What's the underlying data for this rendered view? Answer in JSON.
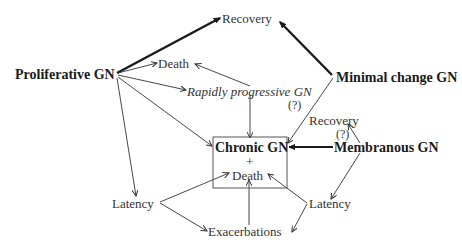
{
  "diagram": {
    "type": "flow-diagram",
    "topic": "Natural history of glomerulonephritis",
    "nodes": {
      "recovery_top": "Recovery",
      "proliferative": "Proliferative GN",
      "death_top": "Death",
      "rapidly_progressive": "Rapidly progressive GN",
      "rapidly_progressive_q": "(?)",
      "minimal_change": "Minimal change GN",
      "recovery_right": "Recovery",
      "recovery_right_q": "(?)",
      "membranous": "Membranous GN",
      "chronic_gn": "Chronic GN",
      "chronic_plus": "+",
      "chronic_death": "Death",
      "latency_left": "Latency",
      "latency_right": "Latency",
      "exacerbations": "Exacerbations"
    },
    "edges": [
      {
        "from": "Proliferative GN",
        "to": "Recovery",
        "weight": "heavy"
      },
      {
        "from": "Minimal change GN",
        "to": "Recovery",
        "weight": "heavy"
      },
      {
        "from": "Proliferative GN",
        "to": "Death",
        "weight": "thin"
      },
      {
        "from": "Proliferative GN",
        "to": "Rapidly progressive GN",
        "weight": "thin"
      },
      {
        "from": "Proliferative GN",
        "to": "Chronic GN + Death",
        "weight": "thin"
      },
      {
        "from": "Proliferative GN",
        "to": "Latency (left)",
        "weight": "thin"
      },
      {
        "from": "Rapidly progressive GN",
        "to": "Death",
        "weight": "thin"
      },
      {
        "from": "Rapidly progressive GN",
        "to": "Chronic GN + Death",
        "weight": "thin"
      },
      {
        "from": "Minimal change GN",
        "to": "Chronic GN + Death",
        "weight": "thin",
        "note": "(?)"
      },
      {
        "from": "Membranous GN",
        "to": "Chronic GN + Death",
        "weight": "heavy"
      },
      {
        "from": "Membranous GN",
        "to": "Recovery (right)",
        "weight": "thin",
        "note": "(?)"
      },
      {
        "from": "Membranous GN",
        "to": "Latency (right)",
        "weight": "thin"
      },
      {
        "from": "Latency (left)",
        "to": "Chronic GN + Death",
        "weight": "thin"
      },
      {
        "from": "Latency (left)",
        "to": "Exacerbations",
        "weight": "thin"
      },
      {
        "from": "Latency (right)",
        "to": "Chronic GN + Death",
        "weight": "thin"
      },
      {
        "from": "Latency (right)",
        "to": "Exacerbations",
        "weight": "thin"
      },
      {
        "from": "Exacerbations",
        "to": "Chronic GN + Death",
        "weight": "thin"
      }
    ]
  }
}
